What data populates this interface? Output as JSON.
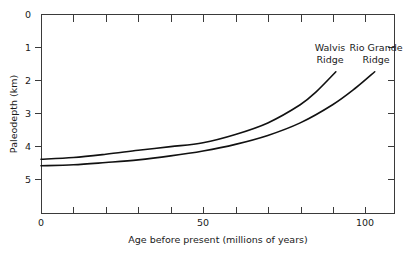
{
  "chart_data": {
    "type": "line",
    "title": "",
    "xlabel": "Age before present (millions of years)",
    "ylabel": "Paleodepth (km)",
    "xlim": [
      0,
      110
    ],
    "ylim": [
      0,
      5.9
    ],
    "y_inverted": true,
    "grid": false,
    "legend_position": "inline-annotations",
    "x_ticks": [
      0,
      10,
      20,
      30,
      40,
      50,
      60,
      70,
      80,
      90,
      100
    ],
    "x_tick_labels": [
      "0",
      "",
      "",
      "",
      "",
      "50",
      "",
      "",
      "",
      "",
      "100"
    ],
    "y_ticks": [
      0,
      1,
      2,
      3,
      4,
      5
    ],
    "y_tick_labels": [
      "0",
      "1",
      "2",
      "3",
      "4",
      "5"
    ],
    "series": [
      {
        "name": "Walvis Ridge",
        "label": "Walvis\nRidge",
        "label_line1": "Walvis",
        "label_line2": "Ridge",
        "color": "#111111",
        "x": [
          0,
          10,
          20,
          30,
          40,
          50,
          60,
          70,
          80,
          85,
          91
        ],
        "y": [
          4.4,
          4.35,
          4.25,
          4.13,
          4.02,
          3.9,
          3.65,
          3.3,
          2.75,
          2.35,
          1.75
        ]
      },
      {
        "name": "Rio Grande Ridge",
        "label": "Rio Grande\nRidge",
        "label_line1": "Rio Grande",
        "label_line2": "Ridge",
        "color": "#111111",
        "x": [
          0,
          10,
          20,
          30,
          40,
          50,
          60,
          70,
          80,
          90,
          97,
          103
        ],
        "y": [
          4.6,
          4.57,
          4.5,
          4.42,
          4.3,
          4.15,
          3.95,
          3.68,
          3.3,
          2.75,
          2.25,
          1.75
        ]
      }
    ],
    "annotations": [
      {
        "text": "Walvis Ridge",
        "x": 92,
        "y": 1.2
      },
      {
        "text": "Rio Grande Ridge",
        "x": 108,
        "y": 1.2
      }
    ]
  }
}
